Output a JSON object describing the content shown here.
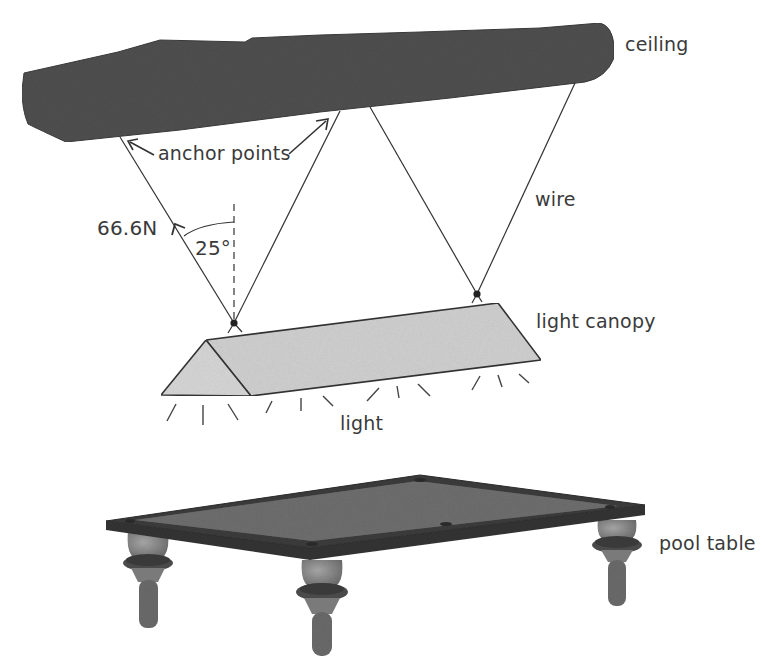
{
  "diagram": {
    "labels": {
      "ceiling": "ceiling",
      "anchor_points": "anchor points",
      "wire": "wire",
      "tension": "66.6N",
      "angle": "25°",
      "light_canopy": "light canopy",
      "light": "light",
      "pool_table": "pool table"
    },
    "colors": {
      "ceiling": "#4f4f4f",
      "canopy": "#d2d2d2",
      "table_rim": "#3a3a3a",
      "table_felt": "#6e6e6e",
      "legs": "#8a8a8a",
      "line": "#333333",
      "text": "#3a3a3a"
    },
    "wires": [
      {
        "from": [
          120,
          137
        ],
        "to": [
          234,
          323
        ]
      },
      {
        "from": [
          340,
          111
        ],
        "to": [
          234,
          323
        ]
      },
      {
        "from": [
          370,
          107
        ],
        "to": [
          477,
          294
        ]
      },
      {
        "from": [
          575,
          83
        ],
        "to": [
          477,
          294
        ]
      }
    ],
    "force": {
      "magnitude": "66.6N",
      "angle_from_vertical": "25°"
    }
  }
}
